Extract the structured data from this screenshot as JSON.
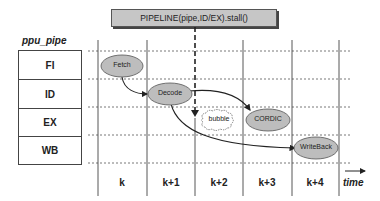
{
  "title": "PIPELINE(pipe,ID/EX).stall()",
  "pipe_label": "ppu_pipe",
  "stages": [
    {
      "label": "FI"
    },
    {
      "label": "ID"
    },
    {
      "label": "EX"
    },
    {
      "label": "WB"
    }
  ],
  "time_slots": [
    {
      "label": "k"
    },
    {
      "label": "k+1"
    },
    {
      "label": "k+2"
    },
    {
      "label": "k+3"
    },
    {
      "label": "k+4"
    }
  ],
  "time_axis_label": "time",
  "nodes": {
    "fetch": "Fetch",
    "decode": "Decode",
    "bubble": "bubble",
    "cordic": "CORDIC",
    "writeback": "WriteBack"
  },
  "colors": {
    "node_fill": "#bdbdbd",
    "node_stroke": "#555555",
    "line": "#444444",
    "title_fill": "#c6c6c6"
  }
}
